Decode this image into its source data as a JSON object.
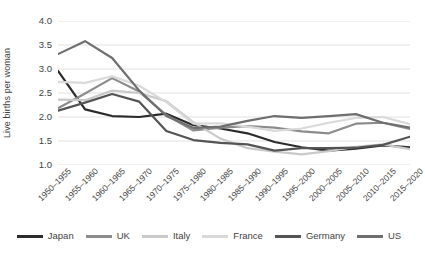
{
  "chart_data": {
    "type": "line",
    "title": "",
    "xlabel": "",
    "ylabel": "Live births per woman",
    "ylim": [
      1.0,
      4.0
    ],
    "yticks": [
      "1.0",
      "1.5",
      "2.0",
      "2.5",
      "3.0",
      "3.5",
      "4.0"
    ],
    "grid": true,
    "legend_position": "bottom",
    "categories": [
      "1950–1955",
      "1955–1960",
      "1960–1965",
      "1965–1970",
      "1970–1975",
      "1975–1980",
      "1980–1985",
      "1985–1990",
      "1990–1995",
      "1995–2000",
      "2000–2005",
      "2005–2010",
      "2010–2015",
      "2015–2020"
    ],
    "series": [
      {
        "name": "Japan",
        "color": "#2b2b2b",
        "values": [
          2.96,
          2.16,
          2.02,
          2.0,
          2.07,
          1.83,
          1.76,
          1.66,
          1.48,
          1.37,
          1.3,
          1.34,
          1.41,
          1.37
        ]
      },
      {
        "name": "UK",
        "color": "#8c8c8c",
        "values": [
          2.18,
          2.49,
          2.81,
          2.53,
          2.04,
          1.72,
          1.78,
          1.81,
          1.78,
          1.7,
          1.66,
          1.86,
          1.88,
          1.75
        ]
      },
      {
        "name": "Italy",
        "color": "#c9c9c9",
        "values": [
          2.36,
          2.35,
          2.55,
          2.5,
          2.33,
          1.89,
          1.55,
          1.35,
          1.28,
          1.22,
          1.29,
          1.38,
          1.43,
          1.33
        ]
      },
      {
        "name": "France",
        "color": "#d9d9d9",
        "values": [
          2.73,
          2.71,
          2.85,
          2.65,
          2.31,
          1.86,
          1.87,
          1.8,
          1.71,
          1.76,
          1.88,
          1.98,
          2.0,
          1.85
        ]
      },
      {
        "name": "Germany",
        "color": "#545454",
        "values": [
          2.13,
          2.3,
          2.48,
          2.32,
          1.71,
          1.52,
          1.46,
          1.43,
          1.3,
          1.35,
          1.35,
          1.36,
          1.42,
          1.59
        ]
      },
      {
        "name": "US",
        "color": "#6e6e6e",
        "values": [
          3.31,
          3.58,
          3.23,
          2.55,
          2.02,
          1.77,
          1.8,
          1.92,
          2.02,
          1.98,
          2.02,
          2.06,
          1.88,
          1.78
        ]
      }
    ]
  },
  "legend": {
    "items": [
      {
        "label": "Japan"
      },
      {
        "label": "UK"
      },
      {
        "label": "Italy"
      },
      {
        "label": "France"
      },
      {
        "label": "Germany"
      },
      {
        "label": "US"
      }
    ]
  }
}
